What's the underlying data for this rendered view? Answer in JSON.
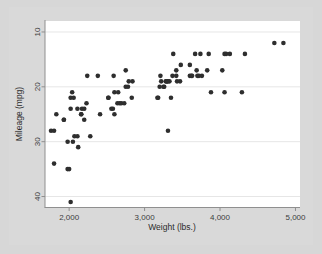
{
  "figure": {
    "background_color": "#d7d7d7",
    "plot_background_color": "#ffffff",
    "marker_color": "#2e2e2e",
    "grid_color": "#e6e6e6",
    "axis_color": "#8f8f8f"
  },
  "chart_data": {
    "type": "scatter",
    "title": "",
    "xlabel": "Weight (lbs.)",
    "ylabel": "Mileage (mpg)",
    "xlim": [
      1680,
      5060
    ],
    "ylim": [
      8,
      42
    ],
    "y_axis_reversed": true,
    "grid": true,
    "legend": null,
    "xticks": [
      2000,
      3000,
      4000,
      5000
    ],
    "xtick_labels": [
      "2,000",
      "3,000",
      "4,000",
      "5,000"
    ],
    "yticks": [
      10,
      20,
      30,
      40
    ],
    "ytick_labels": [
      "10",
      "20",
      "30",
      "40"
    ],
    "series": [
      {
        "name": "Automobiles",
        "marker": "circle",
        "color": "#2e2e2e",
        "points": [
          [
            1760,
            28
          ],
          [
            1800,
            28
          ],
          [
            1800,
            34
          ],
          [
            1830,
            25
          ],
          [
            1930,
            26
          ],
          [
            1930,
            26
          ],
          [
            1980,
            30
          ],
          [
            1980,
            35
          ],
          [
            2000,
            35
          ],
          [
            2020,
            24
          ],
          [
            2020,
            22
          ],
          [
            2020,
            41
          ],
          [
            2040,
            21
          ],
          [
            2050,
            30
          ],
          [
            2060,
            22
          ],
          [
            2070,
            29
          ],
          [
            2110,
            29
          ],
          [
            2110,
            24
          ],
          [
            2120,
            31
          ],
          [
            2160,
            25
          ],
          [
            2160,
            25
          ],
          [
            2170,
            24
          ],
          [
            2200,
            26
          ],
          [
            2200,
            24
          ],
          [
            2230,
            23
          ],
          [
            2240,
            18
          ],
          [
            2280,
            29
          ],
          [
            2380,
            18
          ],
          [
            2410,
            25
          ],
          [
            2520,
            22
          ],
          [
            2520,
            22
          ],
          [
            2560,
            24
          ],
          [
            2580,
            24
          ],
          [
            2590,
            18
          ],
          [
            2600,
            25
          ],
          [
            2600,
            21
          ],
          [
            2640,
            23
          ],
          [
            2650,
            21
          ],
          [
            2670,
            23
          ],
          [
            2690,
            23
          ],
          [
            2730,
            23
          ],
          [
            2750,
            20
          ],
          [
            2750,
            17
          ],
          [
            2780,
            20
          ],
          [
            2790,
            19
          ],
          [
            2830,
            22
          ],
          [
            2840,
            19
          ],
          [
            3170,
            22
          ],
          [
            3180,
            22
          ],
          [
            3200,
            20
          ],
          [
            3210,
            18
          ],
          [
            3220,
            19
          ],
          [
            3250,
            20
          ],
          [
            3260,
            20
          ],
          [
            3280,
            19
          ],
          [
            3290,
            19
          ],
          [
            3300,
            19
          ],
          [
            3310,
            28
          ],
          [
            3310,
            19
          ],
          [
            3330,
            19
          ],
          [
            3350,
            22
          ],
          [
            3370,
            18
          ],
          [
            3380,
            14
          ],
          [
            3420,
            18
          ],
          [
            3420,
            17
          ],
          [
            3430,
            19
          ],
          [
            3470,
            19
          ],
          [
            3480,
            16
          ],
          [
            3600,
            18
          ],
          [
            3600,
            16
          ],
          [
            3620,
            18
          ],
          [
            3630,
            18
          ],
          [
            3670,
            14
          ],
          [
            3690,
            17
          ],
          [
            3700,
            18
          ],
          [
            3720,
            18
          ],
          [
            3740,
            14
          ],
          [
            3760,
            18
          ],
          [
            3830,
            17
          ],
          [
            3850,
            14
          ],
          [
            3880,
            21
          ],
          [
            4030,
            17
          ],
          [
            4060,
            14
          ],
          [
            4060,
            21
          ],
          [
            4080,
            14
          ],
          [
            4130,
            14
          ],
          [
            4290,
            21
          ],
          [
            4330,
            14
          ],
          [
            4720,
            12
          ],
          [
            4840,
            12
          ]
        ]
      }
    ]
  }
}
